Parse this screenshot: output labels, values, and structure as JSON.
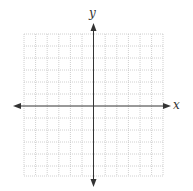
{
  "diagram": {
    "type": "coordinate-plane",
    "grid": {
      "columns": 12,
      "rows": 12,
      "line_color": "#c8c8c8",
      "style": "dotted"
    },
    "axes": {
      "x_label": "x",
      "y_label": "y",
      "color": "#333333",
      "arrows": [
        "left",
        "right",
        "up",
        "down"
      ]
    }
  }
}
